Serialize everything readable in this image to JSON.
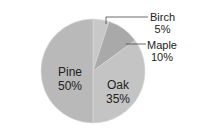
{
  "chart_data": {
    "type": "pie",
    "title": "",
    "categories": [
      "Birch",
      "Maple",
      "Oak",
      "Pine"
    ],
    "values": [
      5,
      10,
      35,
      50
    ],
    "labels": [
      "5%",
      "10%",
      "35%",
      "50%"
    ],
    "colors": [
      "#c8c8c8",
      "#a9a9a9",
      "#c4c4c4",
      "#b9b9b9"
    ],
    "legend": "none (direct labels)"
  },
  "labels": {
    "birch": {
      "name": "Birch",
      "pct": "5%"
    },
    "maple": {
      "name": "Maple",
      "pct": "10%"
    },
    "oak": {
      "name": "Oak",
      "pct": "35%"
    },
    "pine": {
      "name": "Pine",
      "pct": "50%"
    }
  }
}
